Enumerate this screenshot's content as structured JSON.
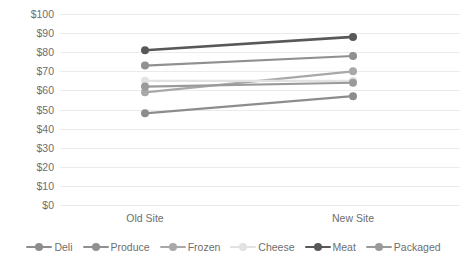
{
  "chart_data": {
    "type": "line",
    "title": "",
    "subtitle": "",
    "xlabel": "",
    "ylabel": "",
    "categories": [
      "Old Site",
      "New Site"
    ],
    "ylim": [
      0,
      100
    ],
    "ytick_step": 10,
    "ytick_labels": [
      "$100",
      "$90",
      "$80",
      "$70",
      "$60",
      "$50",
      "$40",
      "$30",
      "$20",
      "$10",
      "$0"
    ],
    "ytick_values": [
      100,
      90,
      80,
      70,
      60,
      50,
      40,
      30,
      20,
      10,
      0
    ],
    "grid": "horizontal",
    "legend_position": "bottom",
    "value_prefix": "$",
    "series": [
      {
        "name": "Deli",
        "values": [
          48,
          57
        ],
        "color": "#8d8d8d"
      },
      {
        "name": "Produce",
        "values": [
          73,
          78
        ],
        "color": "#909090"
      },
      {
        "name": "Frozen",
        "values": [
          59,
          70
        ],
        "color": "#a8a8a8"
      },
      {
        "name": "Cheese",
        "values": [
          65,
          65
        ],
        "color": "#e2e2e2"
      },
      {
        "name": "Meat",
        "values": [
          81,
          88
        ],
        "color": "#585858"
      },
      {
        "name": "Packaged",
        "values": [
          62,
          64
        ],
        "color": "#9a9a9a"
      }
    ]
  },
  "legend": {
    "items": [
      {
        "label": "Deli"
      },
      {
        "label": "Produce"
      },
      {
        "label": "Frozen"
      },
      {
        "label": "Cheese"
      },
      {
        "label": "Meat"
      },
      {
        "label": "Packaged"
      }
    ]
  },
  "colors": {
    "gridline": "#ebebeb",
    "text": "#6e6e6e",
    "background": "#ffffff"
  }
}
